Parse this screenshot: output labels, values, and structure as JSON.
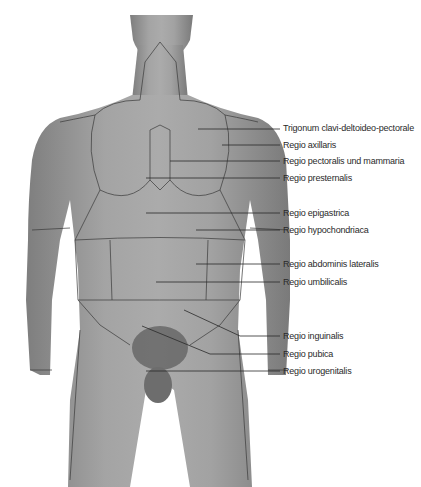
{
  "figure": {
    "colors": {
      "skin": "#9a9a9a",
      "skin_dark": "#7c7c7c",
      "skin_light": "#b0b0b0",
      "line": "#3a3a3a",
      "text": "#2a2a2a"
    },
    "labels": [
      {
        "text": "Trigonum clavi-deltoideo-pectorale",
        "x": 283,
        "y": 123,
        "line_from_x": 198,
        "line_from_y": 129
      },
      {
        "text": "Regio axillaris",
        "x": 283,
        "y": 140,
        "line_from_x": 222,
        "line_from_y": 145
      },
      {
        "text": "Regio pectoralis und mammaria",
        "x": 283,
        "y": 156,
        "line_from_x": 170,
        "line_from_y": 161
      },
      {
        "text": "Regio presternalis",
        "x": 283,
        "y": 173,
        "line_from_x": 146,
        "line_from_y": 178
      },
      {
        "text": "Regio epigastrica",
        "x": 283,
        "y": 208,
        "line_from_x": 146,
        "line_from_y": 213
      },
      {
        "text": "Regio hypochondriaca",
        "x": 283,
        "y": 225,
        "line_from_x": 196,
        "line_from_y": 230
      },
      {
        "text": "Regio abdominis lateralis",
        "x": 283,
        "y": 259,
        "line_from_x": 196,
        "line_from_y": 264
      },
      {
        "text": "Regio umbilicalis",
        "x": 283,
        "y": 277,
        "line_from_x": 156,
        "line_from_y": 282
      },
      {
        "text": "Regio inguinalis",
        "x": 283,
        "y": 331,
        "line_from_x": 184,
        "line_from_y": 310
      },
      {
        "text": "Regio pubica",
        "x": 283,
        "y": 349,
        "line_from_x": 142,
        "line_from_y": 326
      },
      {
        "text": "Regio urogenitalis",
        "x": 283,
        "y": 366,
        "line_from_x": 146,
        "line_from_y": 371
      }
    ]
  }
}
